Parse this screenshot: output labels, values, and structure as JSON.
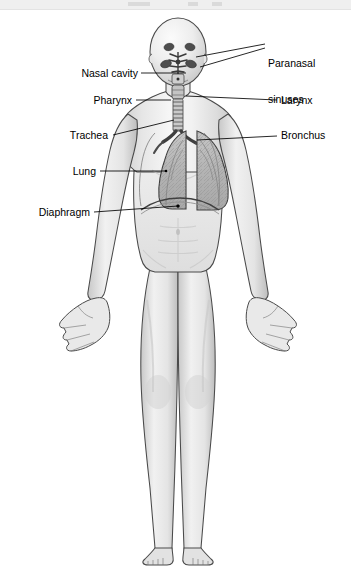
{
  "figure": {
    "background_color": "#ffffff",
    "width": 351,
    "height": 583,
    "ink_color": "#000000",
    "body_fill": "#ededed",
    "organ_fill": "#b9b9b9",
    "top_band_color": "#efefef"
  },
  "labels": [
    {
      "id": "paranasal-sinuses",
      "text": "Paranasal\nsinuses",
      "line1": "Paranasal",
      "line2": "sinuses",
      "side": "right",
      "x": 268,
      "y": 37
    },
    {
      "id": "nasal-cavity",
      "text": "Nasal cavity",
      "side": "left",
      "x": 74,
      "y": 68
    },
    {
      "id": "pharynx",
      "text": "Pharynx",
      "side": "left",
      "x": 86,
      "y": 95
    },
    {
      "id": "larynx",
      "text": "Larynx",
      "side": "right",
      "x": 281,
      "y": 95
    },
    {
      "id": "trachea",
      "text": "Trachea",
      "side": "left",
      "x": 62,
      "y": 130
    },
    {
      "id": "bronchus",
      "text": "Bronchus",
      "side": "right",
      "x": 281,
      "y": 130
    },
    {
      "id": "lung",
      "text": "Lung",
      "side": "left",
      "x": 66,
      "y": 166
    },
    {
      "id": "diaphragm",
      "text": "Diaphragm",
      "side": "left",
      "x": 31,
      "y": 206
    }
  ],
  "structures": [
    {
      "id": "frontal-sinus",
      "name": "Frontal sinus"
    },
    {
      "id": "maxillary-sinus",
      "name": "Maxillary sinus"
    },
    {
      "id": "nasal-cavity-structure",
      "name": "Nasal cavity"
    },
    {
      "id": "pharynx-structure",
      "name": "Pharynx"
    },
    {
      "id": "larynx-structure",
      "name": "Larynx"
    },
    {
      "id": "trachea-structure",
      "name": "Trachea"
    },
    {
      "id": "right-bronchus",
      "name": "Right bronchus"
    },
    {
      "id": "left-bronchus",
      "name": "Left bronchus"
    },
    {
      "id": "right-lung",
      "name": "Right lung"
    },
    {
      "id": "left-lung",
      "name": "Left lung"
    },
    {
      "id": "diaphragm-structure",
      "name": "Diaphragm"
    }
  ]
}
